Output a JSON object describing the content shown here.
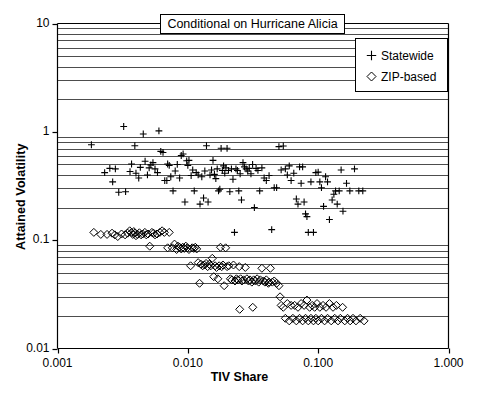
{
  "chart_data": {
    "type": "scatter",
    "title": "Conditional on Hurricane Alicia",
    "xlabel": "TIV Share",
    "ylabel": "Attained Volatility",
    "xscale": "log",
    "yscale": "log",
    "xlim": [
      0.001,
      1.0
    ],
    "ylim": [
      0.01,
      10
    ],
    "xticks": [
      "0.001",
      "0.010",
      "0.100",
      "1.000"
    ],
    "xtick_values": [
      0.001,
      0.01,
      0.1,
      1.0
    ],
    "yticks": [
      "0.01",
      "0.1",
      "1",
      "10"
    ],
    "ytick_values": [
      0.01,
      0.1,
      1,
      10
    ],
    "grid": "horizontal-minor-log",
    "legend_position": "top-right",
    "series": [
      {
        "name": "Statewide",
        "marker": "plus",
        "color": "#000000",
        "points": [
          [
            0.00182,
            0.76
          ],
          [
            0.00265,
            0.345
          ],
          [
            0.00295,
            0.277
          ],
          [
            0.00322,
            1.12
          ],
          [
            0.00252,
            0.46
          ],
          [
            0.00278,
            0.455
          ],
          [
            0.0023,
            0.42
          ],
          [
            0.00333,
            0.28
          ],
          [
            0.0036,
            0.43
          ],
          [
            0.0037,
            0.505
          ],
          [
            0.00392,
            0.745
          ],
          [
            0.004,
            0.415
          ],
          [
            0.0042,
            0.375
          ],
          [
            0.00432,
            0.47
          ],
          [
            0.00455,
            0.955
          ],
          [
            0.0047,
            0.535
          ],
          [
            0.0049,
            0.4
          ],
          [
            0.00505,
            0.465
          ],
          [
            0.0052,
            0.495
          ],
          [
            0.0054,
            0.52
          ],
          [
            0.0056,
            0.455
          ],
          [
            0.00585,
            0.42
          ],
          [
            0.006,
            1.02
          ],
          [
            0.0062,
            0.66
          ],
          [
            0.00645,
            0.645
          ],
          [
            0.00665,
            0.355
          ],
          [
            0.0069,
            0.355
          ],
          [
            0.007,
            0.505
          ],
          [
            0.0072,
            0.49
          ],
          [
            0.0074,
            0.385
          ],
          [
            0.0077,
            0.285
          ],
          [
            0.008,
            0.435
          ],
          [
            0.0083,
            0.5
          ],
          [
            0.00865,
            0.375
          ],
          [
            0.0089,
            0.605
          ],
          [
            0.0092,
            0.625
          ],
          [
            0.0095,
            0.225
          ],
          [
            0.0098,
            0.54
          ],
          [
            0.01,
            0.49
          ],
          [
            0.0102,
            0.545
          ],
          [
            0.0106,
            0.395
          ],
          [
            0.0109,
            0.445
          ],
          [
            0.0112,
            0.285
          ],
          [
            0.0116,
            0.42
          ],
          [
            0.012,
            0.4
          ],
          [
            0.0124,
            0.215
          ],
          [
            0.0128,
            0.385
          ],
          [
            0.0132,
            0.245
          ],
          [
            0.0135,
            0.435
          ],
          [
            0.0139,
            0.745
          ],
          [
            0.0143,
            0.225
          ],
          [
            0.0148,
            0.4
          ],
          [
            0.0152,
            0.445
          ],
          [
            0.0156,
            0.545
          ],
          [
            0.016,
            0.405
          ],
          [
            0.0164,
            0.37
          ],
          [
            0.0168,
            0.455
          ],
          [
            0.0172,
            0.285
          ],
          [
            0.0176,
            0.295
          ],
          [
            0.018,
            0.705
          ],
          [
            0.0184,
            0.44
          ],
          [
            0.0188,
            0.485
          ],
          [
            0.0192,
            0.415
          ],
          [
            0.0196,
            0.465
          ],
          [
            0.02,
            0.705
          ],
          [
            0.0205,
            0.44
          ],
          [
            0.021,
            0.28
          ],
          [
            0.0216,
            0.455
          ],
          [
            0.0222,
            0.365
          ],
          [
            0.0228,
            0.118
          ],
          [
            0.0234,
            0.455
          ],
          [
            0.024,
            0.44
          ],
          [
            0.0246,
            0.285
          ],
          [
            0.0252,
            0.41
          ],
          [
            0.0258,
            0.235
          ],
          [
            0.0265,
            0.52
          ],
          [
            0.0272,
            0.475
          ],
          [
            0.028,
            0.455
          ],
          [
            0.0288,
            0.435
          ],
          [
            0.0296,
            0.46
          ],
          [
            0.0305,
            0.41
          ],
          [
            0.0314,
            0.5
          ],
          [
            0.0324,
            0.2
          ],
          [
            0.0334,
            0.46
          ],
          [
            0.0345,
            0.44
          ],
          [
            0.0356,
            0.285
          ],
          [
            0.037,
            0.465
          ],
          [
            0.0385,
            0.375
          ],
          [
            0.04,
            0.355
          ],
          [
            0.042,
            0.395
          ],
          [
            0.044,
            0.125
          ],
          [
            0.046,
            0.305
          ],
          [
            0.048,
            0.305
          ],
          [
            0.05,
            0.73
          ],
          [
            0.052,
            0.445
          ],
          [
            0.054,
            0.74
          ],
          [
            0.056,
            0.455
          ],
          [
            0.058,
            0.4
          ],
          [
            0.06,
            0.485
          ],
          [
            0.062,
            0.355
          ],
          [
            0.065,
            0.415
          ],
          [
            0.068,
            0.24
          ],
          [
            0.07,
            0.215
          ],
          [
            0.072,
            0.475
          ],
          [
            0.074,
            0.335
          ],
          [
            0.076,
            0.475
          ],
          [
            0.078,
            0.225
          ],
          [
            0.08,
            0.175
          ],
          [
            0.082,
            0.165
          ],
          [
            0.084,
            0.118
          ],
          [
            0.088,
            0.345
          ],
          [
            0.092,
            0.118
          ],
          [
            0.096,
            0.42
          ],
          [
            0.1,
            0.425
          ],
          [
            0.103,
            0.345
          ],
          [
            0.106,
            0.305
          ],
          [
            0.11,
            0.205
          ],
          [
            0.114,
            0.385
          ],
          [
            0.118,
            0.345
          ],
          [
            0.122,
            0.155
          ],
          [
            0.128,
            0.235
          ],
          [
            0.132,
            0.265
          ],
          [
            0.136,
            0.285
          ],
          [
            0.14,
            0.215
          ],
          [
            0.145,
            0.285
          ],
          [
            0.15,
            0.445
          ],
          [
            0.155,
            0.185
          ],
          [
            0.165,
            0.335
          ],
          [
            0.175,
            0.285
          ],
          [
            0.19,
            0.455
          ],
          [
            0.205,
            0.285
          ],
          [
            0.22,
            0.285
          ]
        ]
      },
      {
        "name": "ZIP-based",
        "marker": "diamond",
        "color": "#000000",
        "points": [
          [
            0.0019,
            0.118
          ],
          [
            0.00215,
            0.113
          ],
          [
            0.0024,
            0.113
          ],
          [
            0.00262,
            0.116
          ],
          [
            0.00275,
            0.112
          ],
          [
            0.0029,
            0.108
          ],
          [
            0.0031,
            0.114
          ],
          [
            0.0033,
            0.112
          ],
          [
            0.00345,
            0.116
          ],
          [
            0.00358,
            0.122
          ],
          [
            0.0037,
            0.118
          ],
          [
            0.00378,
            0.113
          ],
          [
            0.00385,
            0.12
          ],
          [
            0.00392,
            0.116
          ],
          [
            0.004,
            0.11
          ],
          [
            0.00412,
            0.113
          ],
          [
            0.00425,
            0.117
          ],
          [
            0.00438,
            0.112
          ],
          [
            0.0045,
            0.114
          ],
          [
            0.00468,
            0.118
          ],
          [
            0.0048,
            0.112
          ],
          [
            0.00495,
            0.114
          ],
          [
            0.0051,
            0.088
          ],
          [
            0.0053,
            0.118
          ],
          [
            0.00545,
            0.116
          ],
          [
            0.0056,
            0.112
          ],
          [
            0.0058,
            0.114
          ],
          [
            0.0061,
            0.118
          ],
          [
            0.00635,
            0.122
          ],
          [
            0.0066,
            0.118
          ],
          [
            0.007,
            0.085
          ],
          [
            0.0072,
            0.118
          ],
          [
            0.0076,
            0.085
          ],
          [
            0.0079,
            0.092
          ],
          [
            0.0082,
            0.082
          ],
          [
            0.0084,
            0.088
          ],
          [
            0.00865,
            0.086
          ],
          [
            0.0089,
            0.083
          ],
          [
            0.00915,
            0.086
          ],
          [
            0.0094,
            0.084
          ],
          [
            0.00965,
            0.088
          ],
          [
            0.0099,
            0.085
          ],
          [
            0.0102,
            0.082
          ],
          [
            0.0105,
            0.058
          ],
          [
            0.0108,
            0.085
          ],
          [
            0.0111,
            0.084
          ],
          [
            0.0114,
            0.086
          ],
          [
            0.0117,
            0.083
          ],
          [
            0.012,
            0.062
          ],
          [
            0.0123,
            0.04
          ],
          [
            0.0126,
            0.06
          ],
          [
            0.013,
            0.058
          ],
          [
            0.0134,
            0.059
          ],
          [
            0.0138,
            0.061
          ],
          [
            0.0142,
            0.057
          ],
          [
            0.0146,
            0.06
          ],
          [
            0.015,
            0.058
          ],
          [
            0.0154,
            0.068
          ],
          [
            0.0158,
            0.046
          ],
          [
            0.0162,
            0.058
          ],
          [
            0.0166,
            0.056
          ],
          [
            0.017,
            0.044
          ],
          [
            0.0174,
            0.058
          ],
          [
            0.0178,
            0.086
          ],
          [
            0.0182,
            0.057
          ],
          [
            0.0186,
            0.059
          ],
          [
            0.019,
            0.038
          ],
          [
            0.0195,
            0.085
          ],
          [
            0.02,
            0.057
          ],
          [
            0.0206,
            0.058
          ],
          [
            0.0212,
            0.044
          ],
          [
            0.0218,
            0.043
          ],
          [
            0.0224,
            0.059
          ],
          [
            0.023,
            0.042
          ],
          [
            0.0236,
            0.044
          ],
          [
            0.0242,
            0.043
          ],
          [
            0.0248,
            0.057
          ],
          [
            0.0254,
            0.044
          ],
          [
            0.026,
            0.042
          ],
          [
            0.0268,
            0.043
          ],
          [
            0.0276,
            0.056
          ],
          [
            0.0284,
            0.044
          ],
          [
            0.0292,
            0.042
          ],
          [
            0.03,
            0.043
          ],
          [
            0.031,
            0.041
          ],
          [
            0.032,
            0.043
          ],
          [
            0.033,
            0.042
          ],
          [
            0.034,
            0.044
          ],
          [
            0.035,
            0.041
          ],
          [
            0.036,
            0.043
          ],
          [
            0.037,
            0.055
          ],
          [
            0.038,
            0.042
          ],
          [
            0.039,
            0.041
          ],
          [
            0.04,
            0.043
          ],
          [
            0.0415,
            0.04
          ],
          [
            0.043,
            0.055
          ],
          [
            0.0445,
            0.041
          ],
          [
            0.046,
            0.042
          ],
          [
            0.048,
            0.04
          ],
          [
            0.05,
            0.038
          ],
          [
            0.052,
            0.025
          ],
          [
            0.054,
            0.024
          ],
          [
            0.056,
            0.019
          ],
          [
            0.058,
            0.026
          ],
          [
            0.06,
            0.018
          ],
          [
            0.062,
            0.025
          ],
          [
            0.064,
            0.019
          ],
          [
            0.066,
            0.025
          ],
          [
            0.068,
            0.018
          ],
          [
            0.07,
            0.024
          ],
          [
            0.072,
            0.019
          ],
          [
            0.074,
            0.026
          ],
          [
            0.076,
            0.018
          ],
          [
            0.078,
            0.025
          ],
          [
            0.08,
            0.019
          ],
          [
            0.082,
            0.028
          ],
          [
            0.084,
            0.018
          ],
          [
            0.086,
            0.024
          ],
          [
            0.088,
            0.019
          ],
          [
            0.09,
            0.025
          ],
          [
            0.092,
            0.018
          ],
          [
            0.094,
            0.024
          ],
          [
            0.096,
            0.019
          ],
          [
            0.098,
            0.026
          ],
          [
            0.1,
            0.018
          ],
          [
            0.103,
            0.024
          ],
          [
            0.106,
            0.019
          ],
          [
            0.109,
            0.025
          ],
          [
            0.112,
            0.018
          ],
          [
            0.115,
            0.024
          ],
          [
            0.118,
            0.019
          ],
          [
            0.122,
            0.026
          ],
          [
            0.126,
            0.018
          ],
          [
            0.13,
            0.024
          ],
          [
            0.134,
            0.019
          ],
          [
            0.138,
            0.025
          ],
          [
            0.142,
            0.018
          ],
          [
            0.148,
            0.019
          ],
          [
            0.154,
            0.024
          ],
          [
            0.16,
            0.018
          ],
          [
            0.168,
            0.019
          ],
          [
            0.176,
            0.018
          ],
          [
            0.185,
            0.019
          ],
          [
            0.195,
            0.018
          ],
          [
            0.21,
            0.019
          ],
          [
            0.225,
            0.018
          ],
          [
            0.042,
            0.041
          ],
          [
            0.025,
            0.023
          ],
          [
            0.0315,
            0.024
          ],
          [
            0.051,
            0.03
          ]
        ]
      }
    ]
  },
  "legend": {
    "items": [
      {
        "symbol": "plus",
        "label": "Statewide"
      },
      {
        "symbol": "diamond",
        "label": "ZIP-based"
      }
    ]
  },
  "caption": ""
}
